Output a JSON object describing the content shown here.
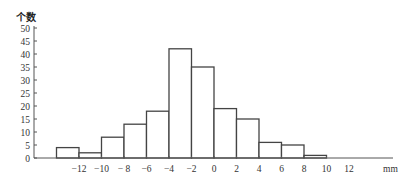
{
  "chart_data": {
    "type": "bar",
    "subtype": "histogram",
    "title": "",
    "ylabel": "个数",
    "xlabel": "mm",
    "bins": [
      {
        "from": -14,
        "to": -12,
        "count": 4
      },
      {
        "from": -12,
        "to": -10,
        "count": 2
      },
      {
        "from": -10,
        "to": -8,
        "count": 8
      },
      {
        "from": -8,
        "to": -6,
        "count": 13
      },
      {
        "from": -6,
        "to": -4,
        "count": 18
      },
      {
        "from": -4,
        "to": -2,
        "count": 42
      },
      {
        "from": -2,
        "to": 0,
        "count": 35
      },
      {
        "from": 0,
        "to": 2,
        "count": 19
      },
      {
        "from": 2,
        "to": 4,
        "count": 15
      },
      {
        "from": 4,
        "to": 6,
        "count": 6
      },
      {
        "from": 6,
        "to": 8,
        "count": 5
      },
      {
        "from": 8,
        "to": 10,
        "count": 1
      }
    ],
    "x_ticks": [
      -12,
      -10,
      -8,
      -6,
      -4,
      -2,
      0,
      2,
      4,
      6,
      8,
      10,
      12
    ],
    "x_tick_labels": [
      "−12",
      "−10",
      "− 8",
      "−6",
      "−4",
      "−2",
      "0",
      "2",
      "4",
      "6",
      "8",
      "10",
      "12"
    ],
    "y_ticks": [
      0,
      5,
      10,
      15,
      20,
      25,
      30,
      35,
      40,
      45,
      50
    ],
    "xlim": [
      -16,
      18
    ],
    "ylim": [
      0,
      50
    ],
    "grid": false,
    "legend": "none"
  }
}
